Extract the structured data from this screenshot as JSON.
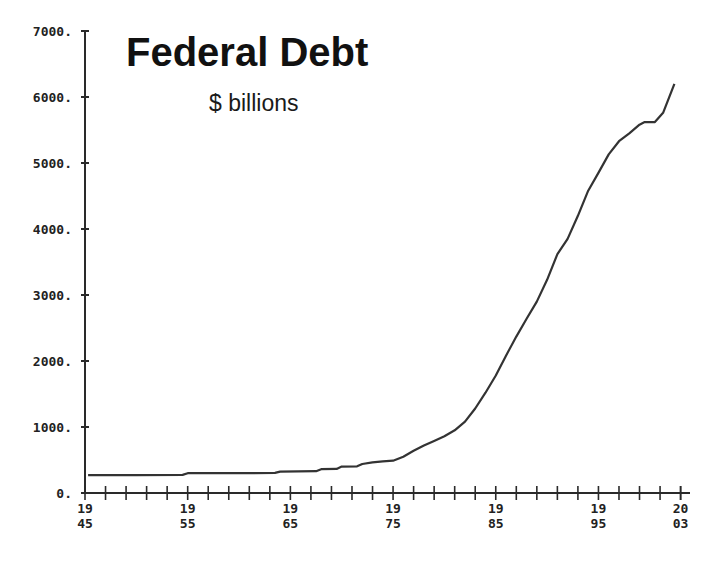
{
  "chart_data": {
    "type": "line",
    "title": "Federal Debt",
    "subtitle": "$ billions",
    "xlabel": "",
    "ylabel": "",
    "xlim": [
      1945,
      2003
    ],
    "ylim": [
      0,
      7000
    ],
    "grid": false,
    "legend": null,
    "y_ticks": [
      "0.",
      "1000.",
      "2000.",
      "3000.",
      "4000.",
      "5000.",
      "6000.",
      "7000."
    ],
    "y_tick_values": [
      0,
      1000,
      2000,
      3000,
      4000,
      5000,
      6000,
      7000
    ],
    "x_tick_labels": [
      {
        "year": 1945,
        "top": "19",
        "bottom": "45"
      },
      {
        "year": 1955,
        "top": "19",
        "bottom": "55"
      },
      {
        "year": 1965,
        "top": "19",
        "bottom": "65"
      },
      {
        "year": 1975,
        "top": "19",
        "bottom": "75"
      },
      {
        "year": 1985,
        "top": "19",
        "bottom": "85"
      },
      {
        "year": 1995,
        "top": "19",
        "bottom": "95"
      },
      {
        "year": 2003,
        "top": "20",
        "bottom": "03"
      }
    ],
    "x_minor_tick_step": 2,
    "series": [
      {
        "name": "Federal Debt ($ billions)",
        "color": "#333333",
        "x": [
          1945.3,
          1950,
          1954.5,
          1955,
          1960,
          1963.5,
          1964,
          1967.5,
          1968,
          1969.5,
          1970,
          1971.5,
          1972,
          1973,
          1974,
          1975,
          1976,
          1977,
          1978,
          1979,
          1980,
          1981,
          1982,
          1983,
          1984,
          1985,
          1986,
          1987,
          1988,
          1989,
          1990,
          1991,
          1992,
          1993,
          1994,
          1995,
          1996,
          1997,
          1998,
          1999,
          1999.5,
          2000.5,
          2001.3,
          2002.4
        ],
        "values": [
          270,
          270,
          275,
          300,
          300,
          305,
          325,
          330,
          360,
          365,
          400,
          405,
          440,
          465,
          480,
          490,
          550,
          640,
          720,
          790,
          860,
          950,
          1080,
          1280,
          1520,
          1780,
          2080,
          2370,
          2640,
          2900,
          3230,
          3620,
          3850,
          4200,
          4580,
          4850,
          5130,
          5330,
          5450,
          5580,
          5620,
          5620,
          5760,
          6200
        ]
      }
    ]
  }
}
